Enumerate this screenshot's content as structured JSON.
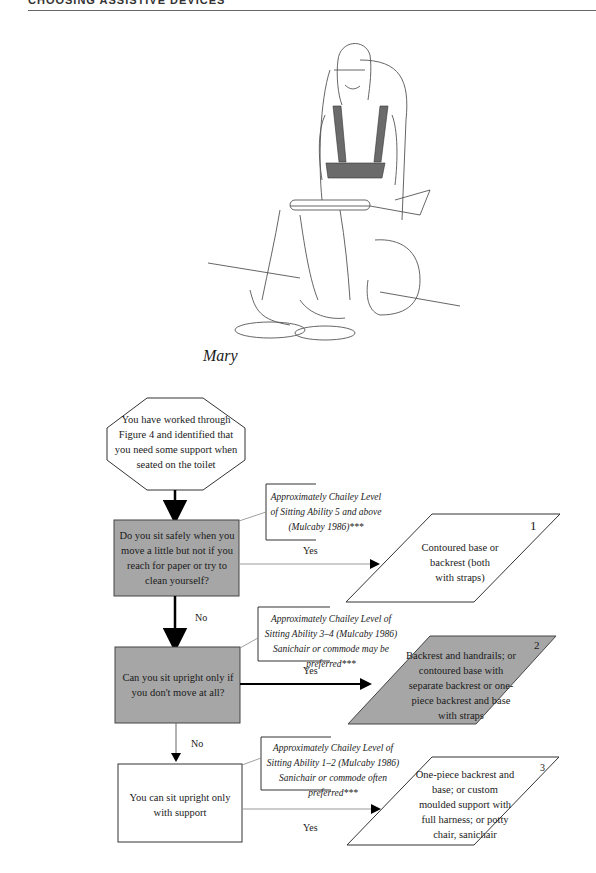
{
  "page": {
    "running_head": "CHOOSING ASSISTIVE DEVICES",
    "illustration": {
      "subject": "girl seated on toilet with harness, handrails and contoured backrest",
      "caption": "Mary"
    }
  },
  "flowchart": {
    "start": {
      "shape": "octagon",
      "text": "You have worked through Figure 4 and identified that you need some support when seated on the toilet"
    },
    "questions": [
      {
        "id": "q1",
        "shape": "rectangle",
        "fill": "#a6a6a6",
        "text": "Do you sit safely when you move a little but not if you reach for paper or try to clean yourself?",
        "note": "Approximately Chailey Level of Sitting Ability 5 and above (Mulcaby 1986)***",
        "yes_label": "Yes",
        "no_label": "No"
      },
      {
        "id": "q2",
        "shape": "rectangle",
        "fill": "#a6a6a6",
        "text": "Can you sit upright only if you don't move at all?",
        "note": "Approximately Chailey Level of Sitting Ability 3–4 (Mulcaby 1986) Sanichair or commode may be preferred***",
        "yes_label": "Yes",
        "no_label": "No"
      },
      {
        "id": "q3",
        "shape": "rectangle",
        "fill": "#ffffff",
        "text": "You can sit upright only with support",
        "note": "Approximately Chailey Level of Sitting Ability 1–2 (Mulcaby 1986) Sanichair or commode often preferred***",
        "yes_label": "Yes"
      }
    ],
    "outcomes": [
      {
        "number": "1",
        "shape": "parallelogram",
        "fill": "#ffffff",
        "text": "Contoured base or backrest (both with straps)"
      },
      {
        "number": "2",
        "shape": "parallelogram",
        "fill": "#a6a6a6",
        "text": "Backrest and handrails; or contoured base with separate backrest or one-piece backrest and base with straps"
      },
      {
        "number": "3",
        "shape": "parallelogram",
        "fill": "#ffffff",
        "text": "One-piece backrest and base; or custom moulded support with full harness; or potty chair, sanichair"
      }
    ]
  },
  "colors": {
    "gray_fill": "#a6a6a6",
    "stroke": "#222222",
    "leader": "#888888"
  }
}
